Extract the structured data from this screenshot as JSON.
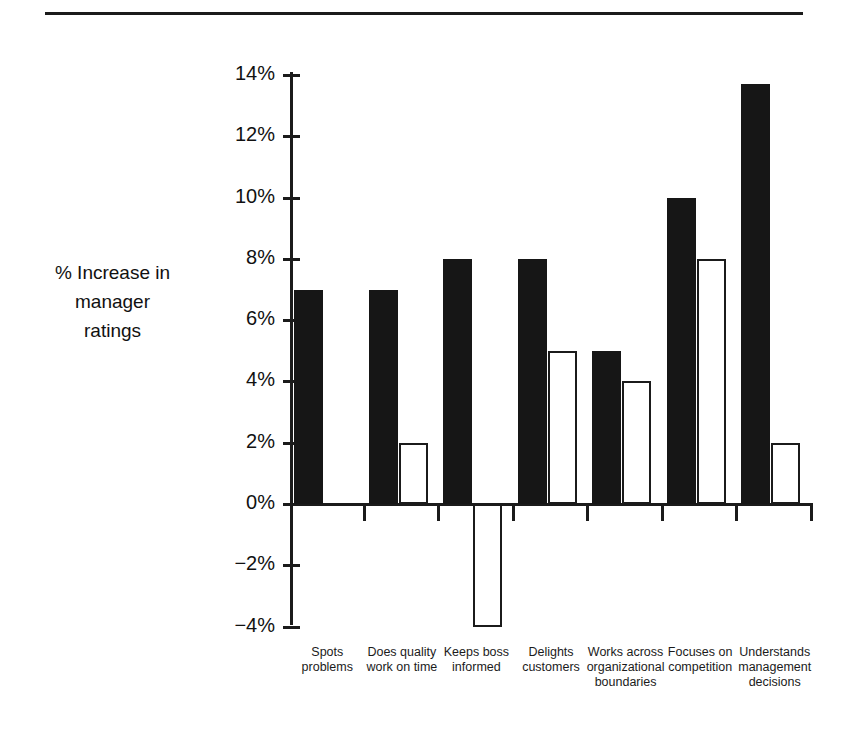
{
  "page": {
    "divider": "horizontal-rule"
  },
  "chart_data": {
    "type": "bar",
    "title": "",
    "xlabel": "",
    "ylabel": "% Increase in\nmanager\nratings",
    "ylim": [
      -4,
      14
    ],
    "ytick_labels": [
      "14%",
      "12%",
      "10%",
      "8%",
      "6%",
      "4%",
      "2%",
      "0%",
      "−2%",
      "−4%"
    ],
    "ytick_values": [
      14,
      12,
      10,
      8,
      6,
      4,
      2,
      0,
      -2,
      -4
    ],
    "ytick_step": 2,
    "grid": false,
    "legend": "none",
    "categories": [
      "Spots\nproblems",
      "Does quality\nwork on time",
      "Keeps boss\ninformed",
      "Delights\ncustomers",
      "Works across\norganizational\nboundaries",
      "Focuses on\ncompetition",
      "Understands\nmanagement\ndecisions"
    ],
    "series": [
      {
        "name": "filled",
        "style": "solid-black",
        "color": "#161616",
        "values": [
          7.0,
          7.0,
          8.0,
          8.0,
          5.0,
          10.0,
          13.7
        ]
      },
      {
        "name": "open",
        "style": "white-outline",
        "color": "#ffffff",
        "edge_color": "#1b1b1b",
        "values": [
          null,
          2.0,
          -4.0,
          5.0,
          4.0,
          8.0,
          2.0
        ]
      }
    ]
  }
}
